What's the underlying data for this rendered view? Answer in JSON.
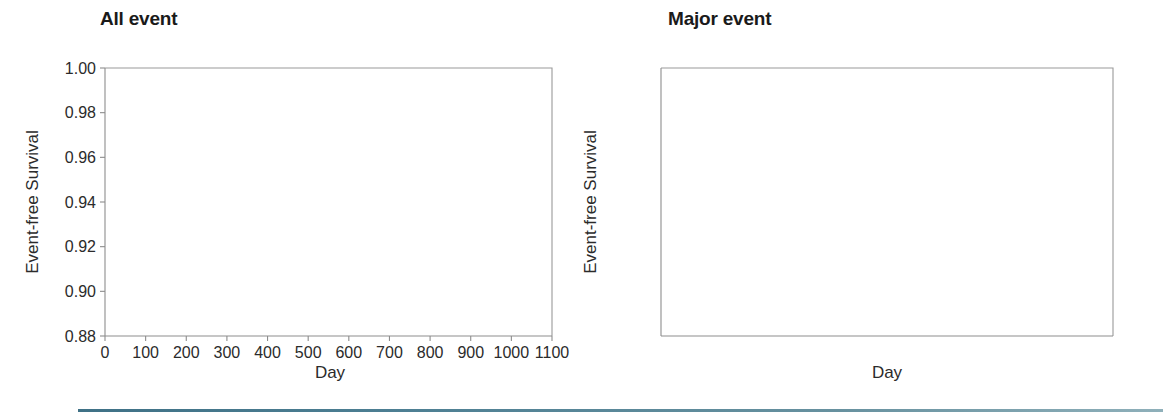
{
  "figure": {
    "panels": [
      {
        "key": "all_event",
        "title": "All event",
        "xlabel": "Day",
        "ylabel": "Event-free Survival"
      },
      {
        "key": "major_event",
        "title": "Major event",
        "xlabel": "Day",
        "ylabel": "Event-free Survival"
      }
    ],
    "legend": {
      "entries": [
        {
          "label": "Selection criteria  I  (N=1662)",
          "color": "#3c9a4e"
        },
        {
          "label": "Selection criteria  II (N=1786)",
          "color": "#e8603c"
        },
        {
          "label": "Selection criteria III (N=1742)",
          "color": "#3f7fc1"
        }
      ]
    },
    "colors": {
      "criteria_1": "#3c9a4e",
      "criteria_2": "#e8603c",
      "criteria_3": "#3f7fc1",
      "axis": "#8d8d8d",
      "text": "#2b2b2b",
      "bottom_rule": "#4d7f93"
    },
    "y_ticks": [
      "1.00",
      "0.98",
      "0.96",
      "0.94",
      "0.92",
      "0.90",
      "0.88"
    ],
    "x_ticks": [
      "0",
      "100",
      "200",
      "300",
      "400",
      "500",
      "600",
      "700",
      "800",
      "900",
      "1000",
      "1100"
    ]
  },
  "chart_data": [
    {
      "type": "line",
      "title": "All event",
      "subtitle": "",
      "xlabel": "Day",
      "ylabel": "Event-free Survival",
      "xlim": [
        0,
        1100
      ],
      "ylim": [
        0.88,
        1.0
      ],
      "xticks": [
        0,
        100,
        200,
        300,
        400,
        500,
        600,
        700,
        800,
        900,
        1000,
        1100
      ],
      "yticks": [
        0.88,
        0.9,
        0.92,
        0.94,
        0.96,
        0.98,
        1.0
      ],
      "grid": false,
      "legend_position": "lower-left-inside",
      "curve_style": "step (Kaplan-Meier)",
      "x": [
        0,
        25,
        50,
        75,
        100,
        125,
        150,
        175,
        200,
        225,
        250,
        275,
        300,
        325,
        350,
        375,
        400,
        425,
        450,
        475,
        500,
        525,
        550,
        575,
        600,
        625,
        650,
        675,
        700,
        725,
        750,
        775,
        800,
        825,
        850,
        875,
        900,
        925,
        950,
        975,
        1000,
        1025,
        1050,
        1075,
        1100
      ],
      "series": [
        {
          "name": "Selection criteria  I  (N=1662)",
          "color": "#3c9a4e",
          "values": [
            1.0,
            0.9985,
            0.9965,
            0.9952,
            0.9942,
            0.9928,
            0.9908,
            0.9882,
            0.9862,
            0.9842,
            0.9818,
            0.9793,
            0.9768,
            0.9742,
            0.9715,
            0.9688,
            0.9658,
            0.9632,
            0.9602,
            0.9578,
            0.9552,
            0.9528,
            0.9505,
            0.9482,
            0.9458,
            0.9432,
            0.9405,
            0.9378,
            0.9352,
            0.9328,
            0.9288,
            0.9262,
            0.9235,
            0.9205,
            0.9172,
            0.9142,
            0.9118,
            0.9092,
            0.9068,
            0.9042,
            0.9018,
            0.8985,
            0.8955,
            0.8938,
            0.893
          ]
        },
        {
          "name": "Selection criteria  II (N=1786)",
          "color": "#e8603c",
          "values": [
            1.0,
            0.9985,
            0.9965,
            0.9952,
            0.9942,
            0.9928,
            0.9908,
            0.9882,
            0.986,
            0.9838,
            0.9812,
            0.9785,
            0.9758,
            0.973,
            0.9702,
            0.9672,
            0.9642,
            0.9612,
            0.9582,
            0.9556,
            0.953,
            0.9505,
            0.9482,
            0.9458,
            0.9432,
            0.9405,
            0.9378,
            0.9352,
            0.9325,
            0.9298,
            0.9258,
            0.9232,
            0.9202,
            0.9172,
            0.914,
            0.9112,
            0.9088,
            0.9062,
            0.9036,
            0.901,
            0.8985,
            0.8952,
            0.8922,
            0.8905,
            0.8898
          ]
        },
        {
          "name": "Selection criteria III (N=1742)",
          "color": "#3f7fc1",
          "values": [
            1.0,
            0.9985,
            0.9965,
            0.9952,
            0.994,
            0.9925,
            0.9905,
            0.9878,
            0.9855,
            0.9828,
            0.9798,
            0.9768,
            0.9738,
            0.9708,
            0.9678,
            0.9648,
            0.9618,
            0.9588,
            0.9558,
            0.953,
            0.9502,
            0.9478,
            0.9452,
            0.9428,
            0.9402,
            0.9375,
            0.9348,
            0.932,
            0.9292,
            0.9265,
            0.9222,
            0.9195,
            0.9165,
            0.9135,
            0.9102,
            0.9072,
            0.9048,
            0.9022,
            0.8995,
            0.8968,
            0.8942,
            0.8908,
            0.8878,
            0.8862,
            0.8858
          ]
        }
      ]
    },
    {
      "type": "line",
      "title": "Major event",
      "subtitle": "",
      "xlabel": "Day",
      "ylabel": "Event-free Survival",
      "xlim": [
        0,
        1100
      ],
      "ylim": [
        0.88,
        1.0
      ],
      "xticks": [
        0,
        100,
        200,
        300,
        400,
        500,
        600,
        700,
        800,
        900,
        1000,
        1100
      ],
      "yticks": [
        0.88,
        0.9,
        0.92,
        0.94,
        0.96,
        0.98,
        1.0
      ],
      "grid": false,
      "legend_position": "lower-left-inside",
      "curve_style": "step (Kaplan-Meier)",
      "x": [
        0,
        25,
        50,
        75,
        100,
        125,
        150,
        175,
        200,
        225,
        250,
        275,
        300,
        325,
        350,
        375,
        400,
        425,
        450,
        475,
        500,
        525,
        550,
        575,
        600,
        625,
        650,
        675,
        700,
        725,
        750,
        775,
        800,
        825,
        850,
        875,
        900,
        925,
        950,
        975,
        1000,
        1025,
        1050,
        1075,
        1100
      ],
      "series": [
        {
          "name": "Selection criteria  I  (N=1662)",
          "color": "#3c9a4e",
          "values": [
            1.0,
            1.0,
            0.9998,
            0.9988,
            0.9982,
            0.9978,
            0.9972,
            0.9968,
            0.9966,
            0.9965,
            0.9963,
            0.9958,
            0.9948,
            0.994,
            0.9934,
            0.9928,
            0.9922,
            0.9918,
            0.9914,
            0.991,
            0.9906,
            0.9904,
            0.99,
            0.9898,
            0.9896,
            0.9892,
            0.9888,
            0.9884,
            0.988,
            0.9876,
            0.987,
            0.9866,
            0.9862,
            0.986,
            0.9856,
            0.9852,
            0.9848,
            0.9844,
            0.984,
            0.9836,
            0.9832,
            0.982,
            0.9812,
            0.9806,
            0.9802
          ]
        },
        {
          "name": "Selection criteria  II (N=1786)",
          "color": "#e8603c",
          "values": [
            1.0,
            1.0,
            0.9998,
            0.9988,
            0.9982,
            0.9977,
            0.9971,
            0.9967,
            0.9965,
            0.9964,
            0.9962,
            0.9956,
            0.9946,
            0.9938,
            0.9932,
            0.9926,
            0.992,
            0.9916,
            0.9912,
            0.9908,
            0.9904,
            0.9902,
            0.9898,
            0.9896,
            0.9894,
            0.989,
            0.9886,
            0.9882,
            0.9878,
            0.9874,
            0.9868,
            0.9864,
            0.986,
            0.9858,
            0.9854,
            0.985,
            0.9846,
            0.9842,
            0.9838,
            0.9834,
            0.983,
            0.9818,
            0.981,
            0.9804,
            0.98
          ]
        },
        {
          "name": "Selection criteria III (N=1742)",
          "color": "#3f7fc1",
          "values": [
            1.0,
            1.0,
            0.9996,
            0.9986,
            0.998,
            0.9975,
            0.9968,
            0.9964,
            0.9962,
            0.996,
            0.9956,
            0.9948,
            0.9936,
            0.9926,
            0.9918,
            0.991,
            0.9902,
            0.9896,
            0.989,
            0.9884,
            0.9878,
            0.9874,
            0.9868,
            0.9864,
            0.986,
            0.9854,
            0.9848,
            0.9842,
            0.9836,
            0.983,
            0.9822,
            0.9816,
            0.981,
            0.9804,
            0.9796,
            0.979,
            0.9784,
            0.978,
            0.9776,
            0.9772,
            0.9768,
            0.9762,
            0.9758,
            0.9756,
            0.9754
          ]
        }
      ]
    }
  ]
}
